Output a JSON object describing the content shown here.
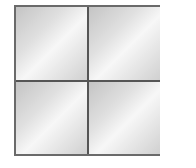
{
  "diagram": {
    "shape": "square",
    "divisions": {
      "rows": 2,
      "cols": 2
    },
    "cells": [
      {
        "position": "top-left",
        "fill": "gray-gradient"
      },
      {
        "position": "top-right",
        "fill": "gray-gradient"
      },
      {
        "position": "bottom-left",
        "fill": "gray-gradient"
      },
      {
        "position": "bottom-right",
        "fill": "gray-gradient"
      }
    ],
    "colors": {
      "border": "#6a6a6a",
      "divider": "#555555",
      "fill_light": "#f7f7f7",
      "fill_dark": "#c4c4c4"
    }
  }
}
